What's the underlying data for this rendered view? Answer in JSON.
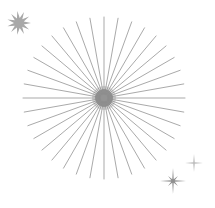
{
  "canvas": {
    "width": 215,
    "height": 208,
    "background": "#ffffff",
    "title": "Starburst and sparkles illustration"
  },
  "palette": {
    "ray_stroke": "#999999",
    "core_fill": "#8a8a8a",
    "star_fill": "#a8a8a8",
    "sparkle_fill": "#8f8f8f",
    "sparkle_faint_fill": "#bdbdbd"
  },
  "elements": [
    {
      "name": "main-starburst",
      "kind": "radial-burst",
      "label": "Main starburst",
      "center_x": 104,
      "center_y": 98,
      "inner_radius": 4,
      "outer_radius": 81,
      "ray_count": 36,
      "ray_width": 0.85,
      "stroke": "#999999",
      "core": {
        "name": "starburst-core",
        "label": "Core blob",
        "radius": 9,
        "fill": "#8a8a8a"
      }
    },
    {
      "name": "spiky-star-top-left",
      "kind": "spiky-star",
      "label": "Spiky star (top left)",
      "center_x": 19,
      "center_y": 23,
      "outer_radius": 12,
      "inner_radius": 5,
      "points": 11,
      "rotation": -8,
      "fill": "#a8a8a8"
    },
    {
      "name": "sparkle-bottom-right",
      "kind": "sparkle",
      "label": "Eight point sparkle (bottom right)",
      "center_x": 173,
      "center_y": 181,
      "long_radius": 13,
      "short_radius": 7,
      "waist": 1.9,
      "points": 8,
      "rotation": 0,
      "fill": "#8f8f8f"
    },
    {
      "name": "sparkle-small-right",
      "kind": "sparkle",
      "label": "Four point sparkle (right)",
      "center_x": 194,
      "center_y": 163,
      "long_radius": 9,
      "short_radius": 4,
      "waist": 1.1,
      "points": 4,
      "rotation": 0,
      "fill": "#bdbdbd"
    }
  ]
}
